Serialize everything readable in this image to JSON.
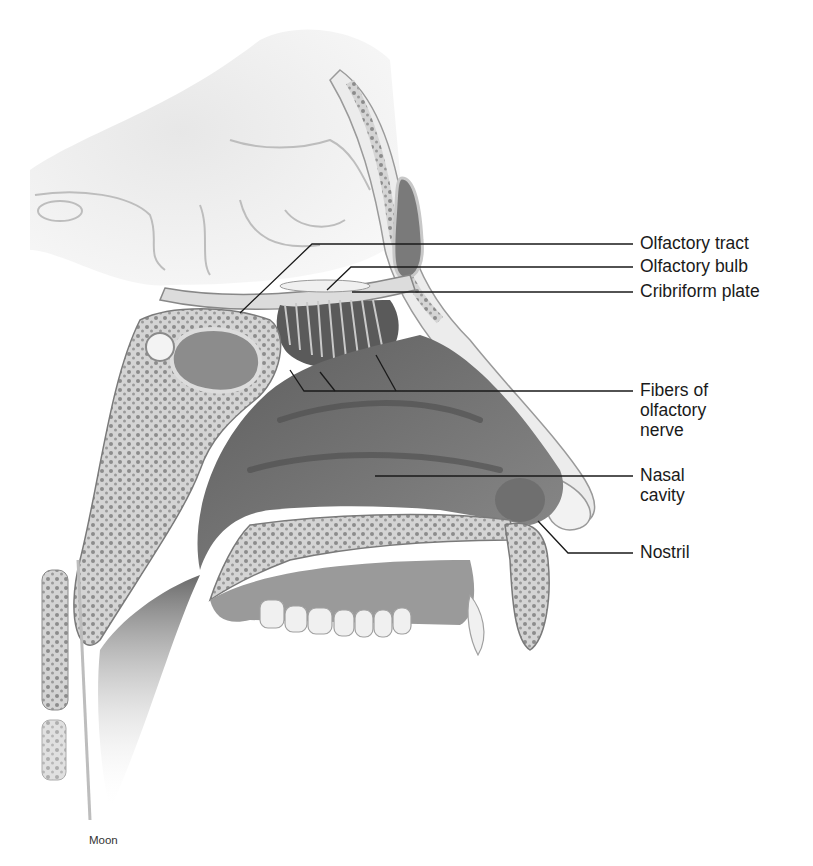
{
  "figure": {
    "type": "anatomical-illustration",
    "colors": {
      "background": "#ffffff",
      "leader_line": "#1a1a1a",
      "label_text": "#1a1a1a",
      "tissue_dark": "#6e6e6e",
      "tissue_mid": "#a9a9a9",
      "tissue_light": "#d9d9d9",
      "bone_outline": "#8a8a8a"
    }
  },
  "labels": [
    {
      "id": "olfactory-tract",
      "text": "Olfactory tract",
      "lines": [
        "Olfactory tract"
      ]
    },
    {
      "id": "olfactory-bulb",
      "text": "Olfactory bulb",
      "lines": [
        "Olfactory bulb"
      ]
    },
    {
      "id": "cribriform-plate",
      "text": "Cribriform plate",
      "lines": [
        "Cribriform plate"
      ]
    },
    {
      "id": "fibers-of-olfactory-nerve",
      "text": "Fibers of olfactory nerve",
      "lines": [
        "Fibers of",
        "olfactory",
        "nerve"
      ]
    },
    {
      "id": "nasal-cavity",
      "text": "Nasal cavity",
      "lines": [
        "Nasal",
        "cavity"
      ]
    },
    {
      "id": "nostril",
      "text": "Nostril",
      "lines": [
        "Nostril"
      ]
    }
  ],
  "credit": "Moon"
}
